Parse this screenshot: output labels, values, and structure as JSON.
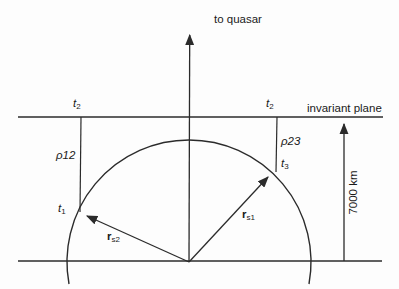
{
  "diagram": {
    "quasar_label": "to quasar",
    "invariant_plane_label": "invariant plane",
    "distance_label": "7000 km",
    "labels": {
      "t2_left": {
        "base": "t",
        "sub": "2"
      },
      "t2_right": {
        "base": "t",
        "sub": "2"
      },
      "t1": {
        "base": "t",
        "sub": "1"
      },
      "t3": {
        "base": "t",
        "sub": "3"
      },
      "rho12": "ρ12",
      "rho23": "ρ23",
      "rs2": {
        "base": "r",
        "sub": "s2"
      },
      "rs1": {
        "base": "r",
        "sub": "s1"
      }
    },
    "colors": {
      "line": "#2b2b2b",
      "text": "#1a1a1a",
      "background": "#fdfdfd"
    }
  }
}
